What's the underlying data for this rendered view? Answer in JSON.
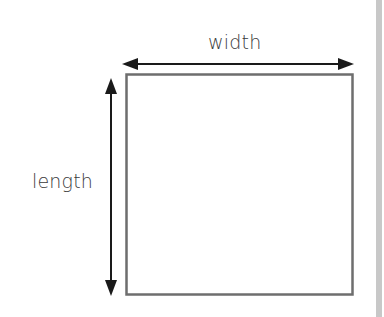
{
  "diagram": {
    "labels": {
      "width": "width",
      "length": "length"
    },
    "colors": {
      "outline": "#6e6e6e",
      "arrow": "#1a1a1a",
      "text": "#3a3a3a",
      "side_bar": "#c8c8c8"
    }
  }
}
